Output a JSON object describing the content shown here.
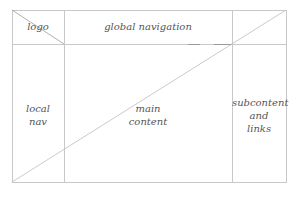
{
  "diagram": {
    "type": "page-layout-wireframe",
    "regions": {
      "logo": {
        "label": "logo"
      },
      "global_navigation": {
        "label": "global navigation"
      },
      "local_nav": {
        "label": "local\nnav"
      },
      "main_content": {
        "label": "main\ncontent"
      },
      "subcontent": {
        "label": "subcontent\nand\nlinks"
      }
    },
    "colors": {
      "line": "#c8c8c8",
      "diagonal": "#bdbdbd",
      "text": "#555555",
      "background": "#ffffff"
    }
  }
}
